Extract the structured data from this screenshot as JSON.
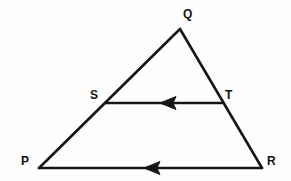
{
  "figure": {
    "kind": "geometry-diagram",
    "background_color": "#fefefe",
    "stroke_color": "#161616",
    "label_color": "#121212",
    "stroke_width": 2.6,
    "canvas": {
      "width": 291,
      "height": 181
    },
    "points": [
      {
        "id": "P",
        "label": "P",
        "x": 39,
        "y": 168,
        "label_x": 21,
        "label_y": 155
      },
      {
        "id": "Q",
        "label": "Q",
        "x": 180,
        "y": 29,
        "label_x": 183,
        "label_y": 8
      },
      {
        "id": "R",
        "label": "R",
        "x": 262,
        "y": 168,
        "label_x": 267,
        "label_y": 155
      },
      {
        "id": "S",
        "label": "S",
        "x": 105,
        "y": 103,
        "label_x": 90,
        "label_y": 89
      },
      {
        "id": "T",
        "label": "T",
        "x": 222,
        "y": 103,
        "label_x": 225,
        "label_y": 89
      }
    ],
    "segments": [
      {
        "id": "PQ",
        "from": "P",
        "to": "Q",
        "arrow": "none"
      },
      {
        "id": "QR",
        "from": "Q",
        "to": "R",
        "arrow": "none"
      },
      {
        "id": "PR",
        "from": "R",
        "to": "P",
        "arrow": "midpoint-toward-P"
      },
      {
        "id": "ST",
        "from": "T",
        "to": "S",
        "arrow": "midpoint-toward-S"
      }
    ],
    "arrow_markers": [
      {
        "id": "arrow-on-ST",
        "on_segment": "ST",
        "x": 168,
        "y": 103,
        "direction": "left"
      },
      {
        "id": "arrow-on-PR",
        "on_segment": "PR",
        "x": 152,
        "y": 168,
        "direction": "left"
      }
    ]
  }
}
